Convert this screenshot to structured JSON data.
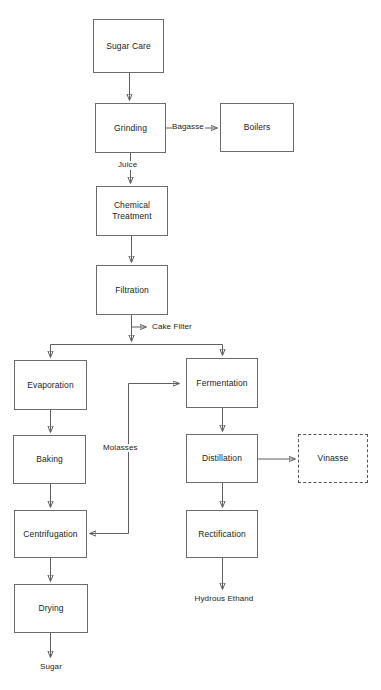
{
  "diagram": {
    "type": "process-flowchart",
    "background": "#ffffff",
    "line_color": "#5f5f5f",
    "box_border_color": "#6b6b6b",
    "text_color": "#1b1b1b"
  },
  "nodes": [
    {
      "id": "sugar_cane",
      "label": "Sugar Care",
      "x": 93,
      "y": 19,
      "w": 71,
      "h": 54,
      "style": "solid"
    },
    {
      "id": "grinding",
      "label": "Grinding",
      "x": 95,
      "y": 103,
      "w": 71,
      "h": 50,
      "style": "solid"
    },
    {
      "id": "boilers",
      "label": "Boilers",
      "x": 220,
      "y": 103,
      "w": 74,
      "h": 49,
      "style": "solid"
    },
    {
      "id": "chemical",
      "label": "Chemical\nTreatment",
      "x": 96,
      "y": 186,
      "w": 72,
      "h": 50,
      "style": "solid"
    },
    {
      "id": "filtration",
      "label": "Filtration",
      "x": 96,
      "y": 265,
      "w": 72,
      "h": 50,
      "style": "solid"
    },
    {
      "id": "evaporation",
      "label": "Evaporation",
      "x": 14,
      "y": 360,
      "w": 73,
      "h": 50,
      "style": "solid"
    },
    {
      "id": "fermentation",
      "label": "Fermentation",
      "x": 186,
      "y": 358,
      "w": 72,
      "h": 50,
      "style": "solid"
    },
    {
      "id": "baking",
      "label": "Baking",
      "x": 13,
      "y": 435,
      "w": 73,
      "h": 49,
      "style": "solid"
    },
    {
      "id": "distillation",
      "label": "Distillation",
      "x": 186,
      "y": 434,
      "w": 72,
      "h": 49,
      "style": "solid"
    },
    {
      "id": "vinasse",
      "label": "Vinasse",
      "x": 298,
      "y": 434,
      "w": 70,
      "h": 49,
      "style": "dashed"
    },
    {
      "id": "centrifugation",
      "label": "Centrifugation",
      "x": 14,
      "y": 510,
      "w": 73,
      "h": 48,
      "style": "solid"
    },
    {
      "id": "rectification",
      "label": "Rectification",
      "x": 186,
      "y": 510,
      "w": 72,
      "h": 48,
      "style": "solid"
    },
    {
      "id": "drying",
      "label": "Drying",
      "x": 14,
      "y": 584,
      "w": 74,
      "h": 49,
      "style": "solid"
    }
  ],
  "edge_labels": [
    {
      "id": "bagasse",
      "text": "Bagasse",
      "x": 172,
      "y": 123
    },
    {
      "id": "juice",
      "text": "Juice",
      "x": 118,
      "y": 162
    },
    {
      "id": "cake_filter",
      "text": "Cake Filter",
      "x": 153,
      "y": 323
    },
    {
      "id": "molasses",
      "text": "Molasses",
      "x": 104,
      "y": 444
    }
  ],
  "terminal_labels": [
    {
      "id": "hydrous_ethanol",
      "text": "Hydrous Ethand",
      "x": 178,
      "y": 595,
      "w": 92
    },
    {
      "id": "sugar",
      "text": "Sugar",
      "x": 32,
      "y": 663,
      "w": 38
    }
  ],
  "connections": [
    {
      "from": "sugar_cane",
      "to": "grinding",
      "label": ""
    },
    {
      "from": "grinding",
      "to": "boilers",
      "label": "Bagasse"
    },
    {
      "from": "grinding",
      "to": "chemical",
      "label": "Juice"
    },
    {
      "from": "chemical",
      "to": "filtration",
      "label": ""
    },
    {
      "from": "filtration",
      "to": "cake_filter",
      "label": "Cake Filter"
    },
    {
      "from": "filtration",
      "to": "evaporation",
      "label": ""
    },
    {
      "from": "filtration",
      "to": "fermentation",
      "label": ""
    },
    {
      "from": "evaporation",
      "to": "baking",
      "label": ""
    },
    {
      "from": "baking",
      "to": "centrifugation",
      "label": ""
    },
    {
      "from": "centrifugation",
      "to": "drying",
      "label": ""
    },
    {
      "from": "drying",
      "to": "sugar",
      "label": ""
    },
    {
      "from": "fermentation",
      "to": "distillation",
      "label": ""
    },
    {
      "from": "distillation",
      "to": "vinasse",
      "label": ""
    },
    {
      "from": "distillation",
      "to": "rectification",
      "label": ""
    },
    {
      "from": "rectification",
      "to": "hydrous_ethanol",
      "label": ""
    },
    {
      "from": "centrifugation",
      "to": "fermentation",
      "label": "Molasses"
    }
  ]
}
